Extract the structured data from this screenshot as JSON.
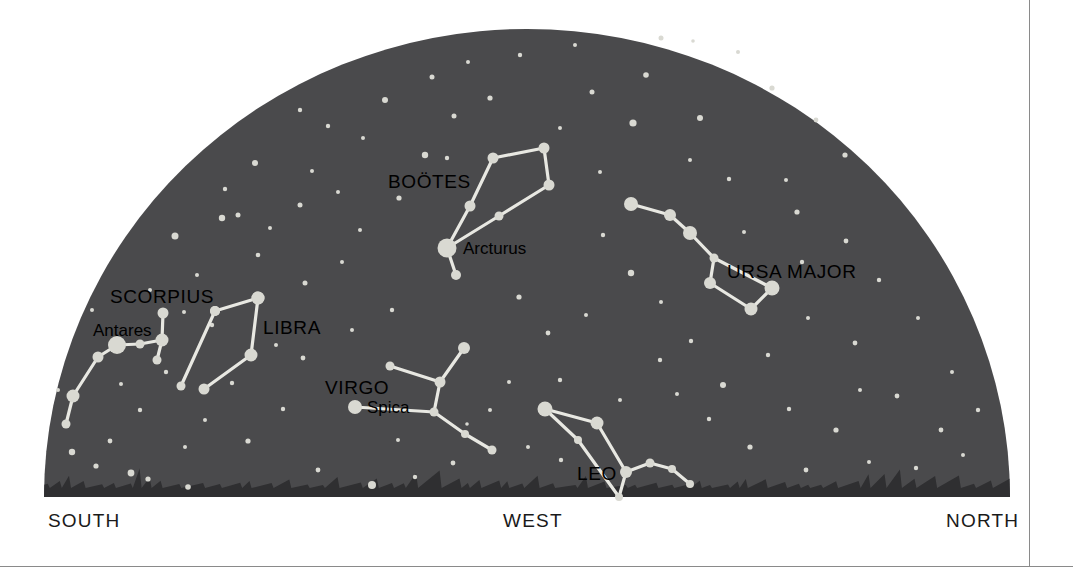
{
  "figure": {
    "type": "sky-map",
    "background_color": "#ffffff",
    "sky_color": "#4a4a4c",
    "horizon_color": "#2f2f31",
    "star_color": "#d9d9d2",
    "line_color": "#e8e8e2",
    "border_color": "#8a8a8a"
  },
  "compass": {
    "south": "SOUTH",
    "west": "WEST",
    "north": "NORTH"
  },
  "chart_data": {
    "type": "sky-map",
    "title": "",
    "view": "Western horizon sky chart",
    "dome": {
      "center_x": 527,
      "baseline_y": 497,
      "radius_x": 483,
      "radius_y": 468
    },
    "constellations": [
      {
        "name": "BOÖTES",
        "label_x": 388,
        "label_y": 188,
        "label_anchor": "start",
        "stars": [
          {
            "id": "arcturus",
            "x": 447,
            "y": 248,
            "r": 9.5,
            "named": true
          },
          {
            "id": "b1",
            "x": 470,
            "y": 206,
            "r": 5.5
          },
          {
            "id": "b2",
            "x": 493,
            "y": 158,
            "r": 5.5
          },
          {
            "id": "b3",
            "x": 544,
            "y": 148,
            "r": 5.5
          },
          {
            "id": "b4",
            "x": 549,
            "y": 185,
            "r": 5.5
          },
          {
            "id": "b5",
            "x": 499,
            "y": 216,
            "r": 4.5
          },
          {
            "id": "b6",
            "x": 456,
            "y": 275,
            "r": 5.0
          }
        ],
        "lines": [
          [
            "arcturus",
            "b1"
          ],
          [
            "b1",
            "b2"
          ],
          [
            "b2",
            "b3"
          ],
          [
            "b3",
            "b4"
          ],
          [
            "b4",
            "b5"
          ],
          [
            "b5",
            "arcturus"
          ],
          [
            "arcturus",
            "b6"
          ]
        ],
        "named_stars": [
          {
            "name": "Arcturus",
            "label_x": 463,
            "label_y": 254,
            "anchor": "start"
          }
        ]
      },
      {
        "name": "URSA MAJOR",
        "label_x": 727,
        "label_y": 278,
        "label_anchor": "start",
        "stars": [
          {
            "id": "u1",
            "x": 631,
            "y": 204,
            "r": 7.0
          },
          {
            "id": "u2",
            "x": 670,
            "y": 215,
            "r": 6.0
          },
          {
            "id": "u3",
            "x": 690,
            "y": 233,
            "r": 7.0
          },
          {
            "id": "u4",
            "x": 714,
            "y": 258,
            "r": 4.5
          },
          {
            "id": "u5",
            "x": 710,
            "y": 283,
            "r": 6.0
          },
          {
            "id": "u6",
            "x": 751,
            "y": 309,
            "r": 6.5
          },
          {
            "id": "u7",
            "x": 772,
            "y": 288,
            "r": 7.5
          }
        ],
        "lines": [
          [
            "u1",
            "u2"
          ],
          [
            "u2",
            "u3"
          ],
          [
            "u3",
            "u4"
          ],
          [
            "u4",
            "u5"
          ],
          [
            "u5",
            "u6"
          ],
          [
            "u6",
            "u7"
          ],
          [
            "u7",
            "u4"
          ]
        ],
        "named_stars": []
      },
      {
        "name": "SCORPIUS",
        "label_x": 110,
        "label_y": 303,
        "label_anchor": "start",
        "stars": [
          {
            "id": "antares",
            "x": 117,
            "y": 345,
            "r": 9.0,
            "named": true
          },
          {
            "id": "s1",
            "x": 140,
            "y": 344,
            "r": 4.5
          },
          {
            "id": "s2",
            "x": 162,
            "y": 340,
            "r": 6.5
          },
          {
            "id": "s3",
            "x": 163,
            "y": 313,
            "r": 5.5
          },
          {
            "id": "s4",
            "x": 157,
            "y": 360,
            "r": 4.5
          },
          {
            "id": "s5",
            "x": 98,
            "y": 357,
            "r": 5.5
          },
          {
            "id": "s6",
            "x": 73,
            "y": 396,
            "r": 6.5
          },
          {
            "id": "s7",
            "x": 66,
            "y": 424,
            "r": 4.5
          },
          {
            "id": "s8",
            "x": 181,
            "y": 386,
            "r": 4.5
          },
          {
            "id": "s9",
            "x": 215,
            "y": 311,
            "r": 5.0
          },
          {
            "id": "s10",
            "x": 258,
            "y": 298,
            "r": 6.5
          }
        ],
        "lines": [
          [
            "antares",
            "s1"
          ],
          [
            "s1",
            "s2"
          ],
          [
            "s2",
            "s3"
          ],
          [
            "s2",
            "s4"
          ],
          [
            "antares",
            "s5"
          ],
          [
            "s5",
            "s6"
          ],
          [
            "s6",
            "s7"
          ],
          [
            "s8",
            "s9"
          ],
          [
            "s9",
            "s10"
          ]
        ],
        "named_stars": [
          {
            "name": "Antares",
            "label_x": 93,
            "label_y": 336,
            "anchor": "start"
          }
        ]
      },
      {
        "name": "LIBRA",
        "label_x": 263,
        "label_y": 334,
        "label_anchor": "start",
        "stars": [
          {
            "id": "l1",
            "x": 258,
            "y": 298,
            "r": 6.5
          },
          {
            "id": "l2",
            "x": 215,
            "y": 311,
            "r": 5.0
          },
          {
            "id": "l3",
            "x": 251,
            "y": 355,
            "r": 6.5
          },
          {
            "id": "l4",
            "x": 204,
            "y": 389,
            "r": 5.5
          }
        ],
        "lines": [
          [
            "l1",
            "l3"
          ],
          [
            "l3",
            "l4"
          ]
        ],
        "named_stars": []
      },
      {
        "name": "VIRGO",
        "label_x": 325,
        "label_y": 394,
        "label_anchor": "start",
        "stars": [
          {
            "id": "spica",
            "x": 355,
            "y": 407,
            "r": 7.0,
            "named": true
          },
          {
            "id": "v1",
            "x": 440,
            "y": 382,
            "r": 5.5
          },
          {
            "id": "v2",
            "x": 390,
            "y": 366,
            "r": 4.5
          },
          {
            "id": "v3",
            "x": 464,
            "y": 348,
            "r": 6.0
          },
          {
            "id": "v4",
            "x": 434,
            "y": 412,
            "r": 4.5
          },
          {
            "id": "v5",
            "x": 465,
            "y": 434,
            "r": 4.0
          },
          {
            "id": "v6",
            "x": 492,
            "y": 450,
            "r": 4.5
          }
        ],
        "lines": [
          [
            "v2",
            "v1"
          ],
          [
            "v1",
            "v3"
          ],
          [
            "v1",
            "v4"
          ],
          [
            "spica",
            "v4"
          ],
          [
            "v4",
            "v5"
          ],
          [
            "v5",
            "v6"
          ]
        ],
        "named_stars": [
          {
            "name": "Spica",
            "label_x": 367,
            "label_y": 413,
            "anchor": "start"
          }
        ]
      },
      {
        "name": "LEO",
        "label_x": 577,
        "label_y": 480,
        "label_anchor": "start",
        "stars": [
          {
            "id": "le1",
            "x": 545,
            "y": 409,
            "r": 7.5
          },
          {
            "id": "le2",
            "x": 597,
            "y": 423,
            "r": 6.5
          },
          {
            "id": "le3",
            "x": 578,
            "y": 440,
            "r": 4.0
          },
          {
            "id": "le4",
            "x": 626,
            "y": 472,
            "r": 6.0
          },
          {
            "id": "le5",
            "x": 650,
            "y": 463,
            "r": 4.5
          },
          {
            "id": "le6",
            "x": 672,
            "y": 469,
            "r": 4.0
          },
          {
            "id": "le7",
            "x": 690,
            "y": 484,
            "r": 4.0
          },
          {
            "id": "le8",
            "x": 619,
            "y": 497,
            "r": 4.0
          }
        ],
        "lines": [
          [
            "le1",
            "le2"
          ],
          [
            "le1",
            "le3"
          ],
          [
            "le2",
            "le4"
          ],
          [
            "le3",
            "le8"
          ],
          [
            "le4",
            "le5"
          ],
          [
            "le5",
            "le6"
          ],
          [
            "le6",
            "le7"
          ],
          [
            "le4",
            "le8"
          ]
        ],
        "named_stars": []
      }
    ],
    "background_stars": [
      {
        "x": 575,
        "y": 45,
        "r": 2.0
      },
      {
        "x": 661,
        "y": 38,
        "r": 2.5
      },
      {
        "x": 693,
        "y": 41,
        "r": 1.8
      },
      {
        "x": 738,
        "y": 52,
        "r": 2.0
      },
      {
        "x": 385,
        "y": 100,
        "r": 3.0
      },
      {
        "x": 328,
        "y": 126,
        "r": 2.2
      },
      {
        "x": 363,
        "y": 138,
        "r": 2.0
      },
      {
        "x": 432,
        "y": 77,
        "r": 2.5
      },
      {
        "x": 454,
        "y": 116,
        "r": 2.5
      },
      {
        "x": 300,
        "y": 110,
        "r": 2.2
      },
      {
        "x": 255,
        "y": 163,
        "r": 3.0
      },
      {
        "x": 225,
        "y": 189,
        "r": 2.2
      },
      {
        "x": 312,
        "y": 171,
        "r": 2.0
      },
      {
        "x": 338,
        "y": 192,
        "r": 2.0
      },
      {
        "x": 222,
        "y": 218,
        "r": 3.2
      },
      {
        "x": 238,
        "y": 215,
        "r": 2.5
      },
      {
        "x": 175,
        "y": 236,
        "r": 3.5
      },
      {
        "x": 258,
        "y": 255,
        "r": 2.3
      },
      {
        "x": 197,
        "y": 275,
        "r": 2.0
      },
      {
        "x": 150,
        "y": 290,
        "r": 2.0
      },
      {
        "x": 212,
        "y": 325,
        "r": 2.2
      },
      {
        "x": 305,
        "y": 283,
        "r": 2.5
      },
      {
        "x": 342,
        "y": 262,
        "r": 2.0
      },
      {
        "x": 300,
        "y": 205,
        "r": 2.5
      },
      {
        "x": 399,
        "y": 198,
        "r": 2.6
      },
      {
        "x": 425,
        "y": 155,
        "r": 3.2
      },
      {
        "x": 447,
        "y": 158,
        "r": 2.2
      },
      {
        "x": 490,
        "y": 98,
        "r": 2.6
      },
      {
        "x": 520,
        "y": 55,
        "r": 2.2
      },
      {
        "x": 592,
        "y": 92,
        "r": 2.5
      },
      {
        "x": 633,
        "y": 123,
        "r": 3.6
      },
      {
        "x": 646,
        "y": 75,
        "r": 2.8
      },
      {
        "x": 700,
        "y": 118,
        "r": 3.0
      },
      {
        "x": 772,
        "y": 88,
        "r": 2.6
      },
      {
        "x": 816,
        "y": 120,
        "r": 2.4
      },
      {
        "x": 845,
        "y": 155,
        "r": 2.6
      },
      {
        "x": 786,
        "y": 180,
        "r": 2.0
      },
      {
        "x": 729,
        "y": 179,
        "r": 2.2
      },
      {
        "x": 600,
        "y": 172,
        "r": 2.0
      },
      {
        "x": 603,
        "y": 235,
        "r": 2.2
      },
      {
        "x": 631,
        "y": 273,
        "r": 3.2
      },
      {
        "x": 661,
        "y": 302,
        "r": 2.0
      },
      {
        "x": 797,
        "y": 212,
        "r": 2.6
      },
      {
        "x": 846,
        "y": 241,
        "r": 2.4
      },
      {
        "x": 879,
        "y": 280,
        "r": 2.2
      },
      {
        "x": 855,
        "y": 343,
        "r": 2.4
      },
      {
        "x": 808,
        "y": 318,
        "r": 2.0
      },
      {
        "x": 768,
        "y": 355,
        "r": 2.2
      },
      {
        "x": 723,
        "y": 385,
        "r": 3.0
      },
      {
        "x": 691,
        "y": 341,
        "r": 2.2
      },
      {
        "x": 660,
        "y": 360,
        "r": 2.2
      },
      {
        "x": 918,
        "y": 318,
        "r": 2.0
      },
      {
        "x": 897,
        "y": 396,
        "r": 2.4
      },
      {
        "x": 941,
        "y": 430,
        "r": 2.4
      },
      {
        "x": 836,
        "y": 430,
        "r": 2.6
      },
      {
        "x": 789,
        "y": 409,
        "r": 2.2
      },
      {
        "x": 750,
        "y": 447,
        "r": 2.6
      },
      {
        "x": 806,
        "y": 470,
        "r": 2.4
      },
      {
        "x": 869,
        "y": 462,
        "r": 2.0
      },
      {
        "x": 916,
        "y": 468,
        "r": 2.2
      },
      {
        "x": 963,
        "y": 455,
        "r": 2.0
      },
      {
        "x": 709,
        "y": 419,
        "r": 2.2
      },
      {
        "x": 548,
        "y": 333,
        "r": 2.4
      },
      {
        "x": 519,
        "y": 297,
        "r": 2.6
      },
      {
        "x": 509,
        "y": 382,
        "r": 2.0
      },
      {
        "x": 560,
        "y": 380,
        "r": 2.2
      },
      {
        "x": 586,
        "y": 315,
        "r": 2.0
      },
      {
        "x": 392,
        "y": 310,
        "r": 2.2
      },
      {
        "x": 352,
        "y": 330,
        "r": 2.0
      },
      {
        "x": 303,
        "y": 358,
        "r": 2.4
      },
      {
        "x": 283,
        "y": 409,
        "r": 2.2
      },
      {
        "x": 248,
        "y": 441,
        "r": 2.6
      },
      {
        "x": 205,
        "y": 420,
        "r": 2.0
      },
      {
        "x": 166,
        "y": 372,
        "r": 2.2
      },
      {
        "x": 140,
        "y": 410,
        "r": 2.2
      },
      {
        "x": 110,
        "y": 441,
        "r": 2.4
      },
      {
        "x": 96,
        "y": 466,
        "r": 2.6
      },
      {
        "x": 72,
        "y": 452,
        "r": 3.2
      },
      {
        "x": 131,
        "y": 473,
        "r": 3.4
      },
      {
        "x": 148,
        "y": 479,
        "r": 2.6
      },
      {
        "x": 188,
        "y": 487,
        "r": 2.8
      },
      {
        "x": 318,
        "y": 470,
        "r": 2.4
      },
      {
        "x": 372,
        "y": 485,
        "r": 4.0
      },
      {
        "x": 415,
        "y": 477,
        "r": 2.2
      },
      {
        "x": 453,
        "y": 463,
        "r": 2.4
      },
      {
        "x": 185,
        "y": 447,
        "r": 2.0
      },
      {
        "x": 232,
        "y": 383,
        "r": 2.2
      },
      {
        "x": 276,
        "y": 345,
        "r": 2.0
      },
      {
        "x": 121,
        "y": 384,
        "r": 2.0
      },
      {
        "x": 398,
        "y": 440,
        "r": 2.0
      },
      {
        "x": 490,
        "y": 410,
        "r": 2.0
      },
      {
        "x": 620,
        "y": 400,
        "r": 2.0
      },
      {
        "x": 677,
        "y": 394,
        "r": 2.0
      },
      {
        "x": 561,
        "y": 460,
        "r": 2.2
      },
      {
        "x": 528,
        "y": 447,
        "r": 2.0
      },
      {
        "x": 467,
        "y": 424,
        "r": 1.8
      },
      {
        "x": 860,
        "y": 390,
        "r": 2.0
      },
      {
        "x": 802,
        "y": 262,
        "r": 2.2
      },
      {
        "x": 744,
        "y": 232,
        "r": 2.0
      },
      {
        "x": 690,
        "y": 160,
        "r": 2.0
      },
      {
        "x": 560,
        "y": 128,
        "r": 2.0
      },
      {
        "x": 468,
        "y": 62,
        "r": 2.0
      },
      {
        "x": 360,
        "y": 230,
        "r": 2.0
      },
      {
        "x": 270,
        "y": 228,
        "r": 2.0
      },
      {
        "x": 184,
        "y": 312,
        "r": 2.0
      },
      {
        "x": 92,
        "y": 310,
        "r": 2.0
      },
      {
        "x": 58,
        "y": 390,
        "r": 2.0
      },
      {
        "x": 978,
        "y": 410,
        "r": 2.2
      },
      {
        "x": 952,
        "y": 372,
        "r": 2.0
      }
    ]
  }
}
